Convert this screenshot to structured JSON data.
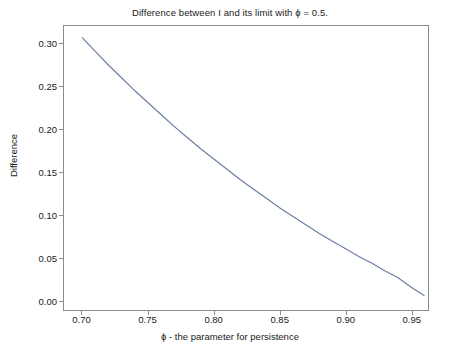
{
  "chart_data": {
    "type": "line",
    "title": "Difference between I and its limit with ϕ = 0.5.",
    "xlabel": "ϕ - the parameter for persistence",
    "ylabel": "Difference",
    "xlim": [
      0.686,
      0.963
    ],
    "ylim": [
      -0.012,
      0.321
    ],
    "grid": false,
    "legend": null,
    "xticks": [
      0.7,
      0.75,
      0.8,
      0.85,
      0.9,
      0.95
    ],
    "xtick_labels": [
      "0.70",
      "0.75",
      "0.80",
      "0.85",
      "0.90",
      "0.95"
    ],
    "yticks": [
      0.0,
      0.05,
      0.1,
      0.15,
      0.2,
      0.25,
      0.3
    ],
    "ytick_labels": [
      "0.00",
      "0.05",
      "0.10",
      "0.15",
      "0.20",
      "0.25",
      "0.30"
    ],
    "line_color": "#6b7fa3",
    "line_width": 1.2,
    "series": [
      {
        "name": "difference",
        "x": [
          0.7,
          0.71,
          0.72,
          0.73,
          0.74,
          0.75,
          0.76,
          0.77,
          0.78,
          0.79,
          0.8,
          0.81,
          0.82,
          0.83,
          0.84,
          0.85,
          0.86,
          0.87,
          0.88,
          0.89,
          0.9,
          0.91,
          0.92,
          0.93,
          0.94,
          0.95,
          0.96
        ],
        "values": [
          0.307,
          0.291,
          0.275,
          0.26,
          0.245,
          0.231,
          0.217,
          0.203,
          0.19,
          0.177,
          0.165,
          0.153,
          0.141,
          0.13,
          0.119,
          0.108,
          0.098,
          0.088,
          0.078,
          0.069,
          0.06,
          0.051,
          0.043,
          0.034,
          0.026,
          0.015,
          0.005
        ]
      }
    ]
  },
  "figure": {
    "background_color": "#ffffff",
    "axes_color": "#8a8a8a",
    "text_color": "#1a1a1a"
  }
}
